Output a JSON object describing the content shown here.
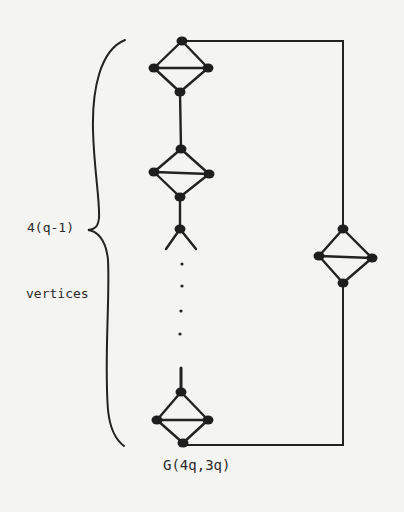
{
  "diagram": {
    "caption": "G(4q,3q)",
    "brace_label_top": "4(q-1)",
    "brace_label_bottom": "vertices",
    "colors": {
      "ink": "#222222",
      "paper": "#f4f4f2"
    },
    "nodes": [
      {
        "id": "d1_top",
        "x": 182,
        "y": 41
      },
      {
        "id": "d1_left",
        "x": 154,
        "y": 68
      },
      {
        "id": "d1_right",
        "x": 208,
        "y": 68
      },
      {
        "id": "d1_bottom",
        "x": 180,
        "y": 92
      },
      {
        "id": "d2_top",
        "x": 181,
        "y": 149
      },
      {
        "id": "d2_left",
        "x": 154,
        "y": 172
      },
      {
        "id": "d2_right",
        "x": 209,
        "y": 174
      },
      {
        "id": "d2_bottom",
        "x": 180,
        "y": 197
      },
      {
        "id": "stub_mid",
        "x": 180,
        "y": 229
      },
      {
        "id": "d3_top",
        "x": 181,
        "y": 392
      },
      {
        "id": "d3_left",
        "x": 157,
        "y": 420
      },
      {
        "id": "d3_right",
        "x": 208,
        "y": 420
      },
      {
        "id": "d3_bottom",
        "x": 183,
        "y": 443
      },
      {
        "id": "r_top",
        "x": 343,
        "y": 229
      },
      {
        "id": "r_left",
        "x": 319,
        "y": 256
      },
      {
        "id": "r_right",
        "x": 372,
        "y": 258
      },
      {
        "id": "r_bottom",
        "x": 343,
        "y": 283
      }
    ],
    "edges": [
      [
        "d1_top",
        "d1_left"
      ],
      [
        "d1_top",
        "d1_right"
      ],
      [
        "d1_left",
        "d1_right"
      ],
      [
        "d1_left",
        "d1_bottom"
      ],
      [
        "d1_right",
        "d1_bottom"
      ],
      [
        "d1_bottom",
        "d2_top"
      ],
      [
        "d2_top",
        "d2_left"
      ],
      [
        "d2_top",
        "d2_right"
      ],
      [
        "d2_left",
        "d2_right"
      ],
      [
        "d2_left",
        "d2_bottom"
      ],
      [
        "d2_right",
        "d2_bottom"
      ],
      [
        "d2_bottom",
        "stub_mid"
      ],
      [
        "d3_top",
        "d3_left"
      ],
      [
        "d3_top",
        "d3_right"
      ],
      [
        "d3_left",
        "d3_right"
      ],
      [
        "d3_left",
        "d3_bottom"
      ],
      [
        "d3_right",
        "d3_bottom"
      ],
      [
        "r_top",
        "r_left"
      ],
      [
        "r_top",
        "r_right"
      ],
      [
        "r_left",
        "r_right"
      ],
      [
        "r_left",
        "r_bottom"
      ],
      [
        "r_right",
        "r_bottom"
      ]
    ],
    "ellipsis_dots": [
      {
        "x": 182,
        "y": 264
      },
      {
        "x": 182,
        "y": 286
      },
      {
        "x": 181,
        "y": 311
      },
      {
        "x": 180,
        "y": 334
      }
    ]
  }
}
